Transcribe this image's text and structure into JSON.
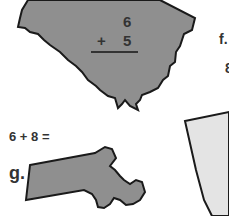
{
  "worksheet": {
    "problem_e": {
      "shape": "south-carolina-silhouette",
      "top_number": "6",
      "operator": "+",
      "bottom_number": "5"
    },
    "problem_f": {
      "label": "f.",
      "partial_text": "8"
    },
    "problem_g": {
      "equation": "6 + 8 =",
      "label": "g.",
      "shape": "massachusetts-silhouette"
    },
    "partial_shape_right": "light-gray-state-silhouette"
  },
  "colors": {
    "shape_fill_dark": "#8f8f8f",
    "shape_fill_light": "#e4e4e4",
    "outline": "#1a1a1a",
    "text": "#333333",
    "background": "#ffffff"
  }
}
